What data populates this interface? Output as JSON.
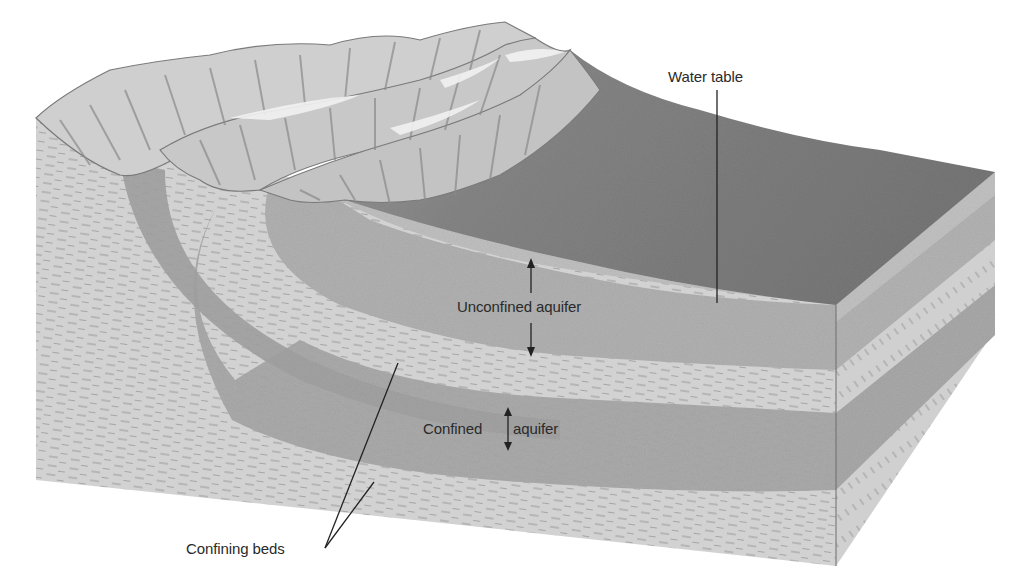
{
  "diagram": {
    "type": "block-diagram",
    "labels": {
      "water_table": "Water table",
      "unconfined_aquifer": "Unconfined aquifer",
      "confined_aquifer_left": "Confined",
      "confined_aquifer_right": "aquifer",
      "confining_beds": "Confining beds"
    },
    "colors": {
      "background": "#ffffff",
      "surface_dark": "#7d7d7d",
      "aquifer_sand": "#a9a9a9",
      "aquifer_sand_light": "#bdbdbd",
      "confining_bed": "#cfcfcf",
      "ridge_light": "#d8d8d8",
      "ridge_shadow": "#8a8a8a",
      "line": "#222222",
      "text": "#2a2a2a"
    }
  }
}
